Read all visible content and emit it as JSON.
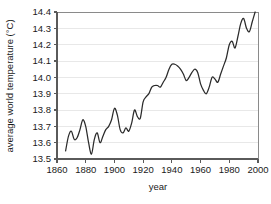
{
  "chart_data": {
    "type": "line",
    "title": "",
    "xlabel": "year",
    "ylabel": "average world temperature (°C)",
    "xlim": [
      1860,
      2000
    ],
    "ylim": [
      13.5,
      14.4
    ],
    "xticks": [
      1860,
      1880,
      1900,
      1920,
      1940,
      1960,
      1980,
      2000
    ],
    "xtick_labels": [
      "1860",
      "1880",
      "1900",
      "1920",
      "1940",
      "1960",
      "1980",
      "2000"
    ],
    "yticks": [
      13.5,
      13.6,
      13.7,
      13.8,
      13.9,
      14.0,
      14.1,
      14.2,
      14.3,
      14.4
    ],
    "ytick_labels": [
      "13.5",
      "13.6",
      "13.7",
      "13.8",
      "13.9",
      "14.0",
      "14.1",
      "14.2",
      "14.3",
      "14.4"
    ],
    "grid": true,
    "grid_axis": "y",
    "legend": false,
    "legend_position": "none",
    "line_color": "#2b2b2b",
    "grid_color": "#e8e8e8",
    "axis_color": "#5a5a5a",
    "series": [
      {
        "name": "average world temperature",
        "x": [
          1866,
          1868,
          1870,
          1872,
          1874,
          1876,
          1878,
          1880,
          1882,
          1884,
          1886,
          1888,
          1890,
          1892,
          1894,
          1896,
          1898,
          1900,
          1902,
          1904,
          1906,
          1908,
          1910,
          1912,
          1914,
          1916,
          1918,
          1920,
          1922,
          1924,
          1926,
          1928,
          1930,
          1932,
          1934,
          1936,
          1938,
          1940,
          1942,
          1944,
          1946,
          1948,
          1950,
          1952,
          1954,
          1956,
          1958,
          1960,
          1962,
          1964,
          1966,
          1968,
          1970,
          1972,
          1974,
          1976,
          1978,
          1980,
          1982,
          1984,
          1986,
          1988,
          1990,
          1992,
          1994,
          1996,
          1998
        ],
        "values": [
          13.55,
          13.64,
          13.67,
          13.62,
          13.63,
          13.68,
          13.74,
          13.7,
          13.6,
          13.53,
          13.62,
          13.66,
          13.6,
          13.64,
          13.68,
          13.7,
          13.74,
          13.81,
          13.77,
          13.68,
          13.66,
          13.69,
          13.67,
          13.72,
          13.8,
          13.76,
          13.75,
          13.85,
          13.88,
          13.9,
          13.94,
          13.95,
          13.95,
          13.94,
          13.97,
          14.0,
          14.05,
          14.08,
          14.08,
          14.07,
          14.05,
          14.02,
          13.98,
          14.0,
          14.03,
          14.05,
          14.03,
          13.96,
          13.92,
          13.9,
          13.94,
          14.0,
          13.99,
          13.97,
          14.02,
          14.07,
          14.12,
          14.2,
          14.22,
          14.18,
          14.25,
          14.33,
          14.36,
          14.3,
          14.28,
          14.34,
          14.4
        ]
      }
    ]
  }
}
